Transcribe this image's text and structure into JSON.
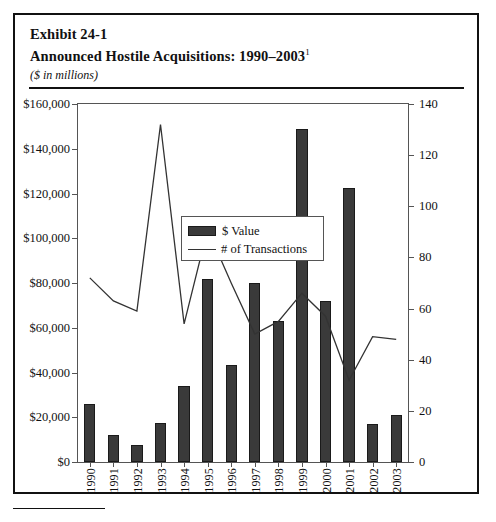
{
  "exhibit": {
    "number_line": "Exhibit 24-1",
    "title": "Announced Hostile Acquisitions: 1990–2003",
    "title_footnote_marker": "1",
    "units_note": "($ in millions)"
  },
  "legend": {
    "position": "top-left-inside-plot",
    "entries": [
      {
        "label": "$ Value",
        "marker": "filled-bar-swatch",
        "color": "#3a3a3a"
      },
      {
        "label": "# of Transactions",
        "marker": "line-swatch",
        "color": "#333333"
      }
    ]
  },
  "axes": {
    "left_title": "",
    "right_title": "",
    "left_ticks": [
      "$0",
      "$20,000",
      "$40,000",
      "$60,000",
      "$80,000",
      "$100,000",
      "$120,000",
      "$140,000",
      "$160,000"
    ],
    "right_ticks": [
      "0",
      "20",
      "40",
      "60",
      "80",
      "100",
      "120",
      "140"
    ],
    "left_range": [
      0,
      160000
    ],
    "right_range": [
      0,
      140
    ],
    "x_ticks": [
      "1990",
      "1991",
      "1992",
      "1993",
      "1994",
      "1995",
      "1996",
      "1997",
      "1998",
      "1999",
      "2000",
      "2001",
      "2002",
      "2003"
    ]
  },
  "chart_data": {
    "type": "bar",
    "title": "Announced Hostile Acquisitions: 1990–2003",
    "subtitle": "($ in millions)",
    "xlabel": "",
    "ylabel": "$ Value ($ in millions)",
    "y2label": "# of Transactions",
    "categories": [
      "1990",
      "1991",
      "1992",
      "1993",
      "1994",
      "1995",
      "1996",
      "1997",
      "1998",
      "1999",
      "2000",
      "2001",
      "2002",
      "2003"
    ],
    "ylim": [
      0,
      160000
    ],
    "y2lim": [
      0,
      140
    ],
    "grid": false,
    "legend_position": "upper left",
    "series": [
      {
        "name": "$ Value",
        "type": "bar",
        "axis": "left",
        "color": "#3a3a3a",
        "values": [
          26000,
          12000,
          7500,
          17500,
          34000,
          82000,
          43500,
          80000,
          63000,
          149000,
          72000,
          122500,
          17000,
          21000
        ]
      },
      {
        "name": "# of Transactions",
        "type": "line",
        "axis": "right",
        "color": "#333333",
        "values": [
          72,
          63,
          59,
          132,
          54,
          91,
          70,
          50,
          55,
          66,
          57,
          32,
          49,
          48
        ]
      }
    ]
  }
}
